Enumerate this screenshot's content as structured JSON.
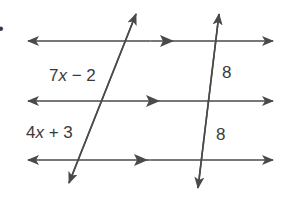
{
  "figure": {
    "type": "parallel lines cut by two transversals",
    "bullet": "•",
    "colors": {
      "line": "#4a4a4a",
      "text": "#3a3a3a",
      "background": "#ffffff"
    },
    "parallel_lines": [
      {
        "id": "line-1",
        "y": 41,
        "x1": 28,
        "x2": 273,
        "mid_arrow_x": 172
      },
      {
        "id": "line-2",
        "y": 101,
        "x1": 28,
        "x2": 273,
        "mid_arrow_x": 158
      },
      {
        "id": "line-3",
        "y": 160,
        "x1": 28,
        "x2": 273,
        "mid_arrow_x": 146
      }
    ],
    "transversals": [
      {
        "id": "left-transversal",
        "x1": 136,
        "y1": 14,
        "x2": 69,
        "y2": 183
      },
      {
        "id": "right-transversal",
        "x1": 219,
        "y1": 14,
        "x2": 198,
        "y2": 188
      }
    ],
    "labels": {
      "left_top": {
        "coef": "7",
        "var": "x",
        "op": " − ",
        "const": "2"
      },
      "left_bottom": {
        "coef": "4",
        "var": "x",
        "op": " + ",
        "const": "3"
      },
      "right_top": "8",
      "right_bottom": "8"
    }
  }
}
